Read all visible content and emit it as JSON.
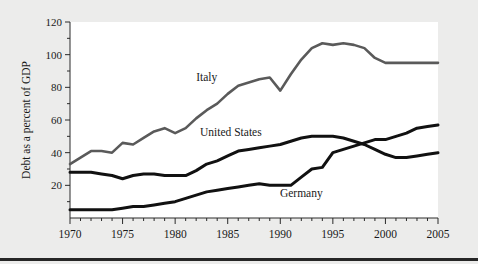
{
  "figure": {
    "background_color": "#ececeb",
    "plot_background_color": "#ffffff",
    "bottom_rule_color": "#262626"
  },
  "chart_data": {
    "type": "line",
    "title": "",
    "xlabel": "",
    "ylabel": "Debt as a percent of GDP",
    "xlim": [
      1970,
      2005
    ],
    "ylim": [
      0,
      120
    ],
    "grid": false,
    "legend_position": "inline-labels",
    "y_ticks_major": [
      20,
      40,
      60,
      80,
      100,
      120
    ],
    "y_ticks_minor": [
      10,
      30,
      50,
      70,
      90,
      110
    ],
    "x_ticks_major": [
      1970,
      1975,
      1980,
      1985,
      1990,
      1995,
      2000,
      2005
    ],
    "x_tick_labels": [
      "1970",
      "1975",
      "1980",
      "1985",
      "1990",
      "1995",
      "2000",
      "2005"
    ],
    "y_tick_labels": [
      "20",
      "40",
      "60",
      "80",
      "100",
      "120"
    ],
    "x_tick_interval_minor": 1,
    "x": [
      1970,
      1971,
      1972,
      1973,
      1974,
      1975,
      1976,
      1977,
      1978,
      1979,
      1980,
      1981,
      1982,
      1983,
      1984,
      1985,
      1986,
      1987,
      1988,
      1989,
      1990,
      1991,
      1992,
      1993,
      1994,
      1995,
      1996,
      1997,
      1998,
      1999,
      2000,
      2001,
      2002,
      2003,
      2004,
      2005
    ],
    "series": [
      {
        "name": "Italy",
        "color": "#5a5a5a",
        "stroke_width": 2.6,
        "label_x": 1983.0,
        "label_y": 84,
        "values": [
          33,
          37,
          41,
          41,
          40,
          46,
          45,
          49,
          53,
          55,
          52,
          55,
          61,
          66,
          70,
          76,
          81,
          83,
          85,
          86,
          78,
          88,
          97,
          104,
          107,
          106,
          107,
          106,
          104,
          98,
          95,
          95,
          95,
          95,
          95,
          95
        ]
      },
      {
        "name": "United States",
        "color": "#111111",
        "stroke_width": 3.0,
        "label_x": 1985.3,
        "label_y": 50,
        "values": [
          28,
          28,
          28,
          27,
          26,
          24,
          26,
          27,
          27,
          26,
          26,
          26,
          29,
          33,
          35,
          38,
          41,
          42,
          43,
          44,
          45,
          47,
          49,
          50,
          50,
          50,
          49,
          47,
          45,
          42,
          39,
          37,
          37,
          38,
          39,
          40
        ]
      },
      {
        "name": "Germany",
        "color": "#111111",
        "stroke_width": 3.0,
        "label_x": 1992.0,
        "label_y": 13,
        "values": [
          5,
          5,
          5,
          5,
          5,
          6,
          7,
          7,
          8,
          9,
          10,
          12,
          14,
          16,
          17,
          18,
          19,
          20,
          21,
          20,
          20,
          20,
          25,
          30,
          31,
          40,
          42,
          44,
          46,
          48,
          48,
          50,
          52,
          55,
          56,
          57
        ]
      }
    ]
  },
  "axis": {
    "y_title": "Debt as a percent of GDP"
  },
  "labels": {
    "italy": "Italy",
    "united_states": "United States",
    "germany": "Germany"
  }
}
